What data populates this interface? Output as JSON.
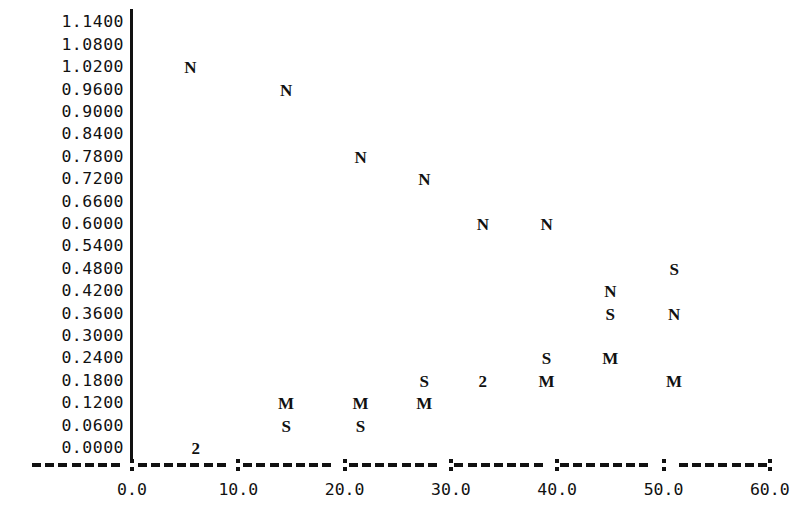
{
  "chart_data": {
    "type": "scatter",
    "title": "",
    "subtitle": "",
    "xlabel": "",
    "ylabel": "",
    "xlim": [
      -2.0,
      62.0
    ],
    "ylim": [
      0.0,
      1.14
    ],
    "grid": false,
    "legend": "none",
    "marker_style": "text-letter",
    "y_ticks": [
      "1.1400",
      "1.0800",
      "1.0200",
      "0.9600",
      "0.9000",
      "0.8400",
      "0.7800",
      "0.7200",
      "0.6600",
      "0.6000",
      "0.5400",
      "0.4800",
      "0.4200",
      "0.3600",
      "0.3000",
      "0.2400",
      "0.1800",
      "0.1200",
      "0.0600",
      "0.0000"
    ],
    "y_tick_values": [
      1.14,
      1.08,
      1.02,
      0.96,
      0.9,
      0.84,
      0.78,
      0.72,
      0.66,
      0.6,
      0.54,
      0.48,
      0.42,
      0.36,
      0.3,
      0.24,
      0.18,
      0.12,
      0.06,
      0.0
    ],
    "x_ticks": [
      "0.0",
      "10.0",
      "20.0",
      "30.0",
      "40.0",
      "50.0",
      "60.0"
    ],
    "x_tick_values": [
      0,
      10,
      20,
      30,
      40,
      50,
      60
    ],
    "series": [
      {
        "name": "N",
        "label": "N",
        "points": [
          {
            "x": 5.5,
            "y": 1.02,
            "label": "N"
          },
          {
            "x": 14.5,
            "y": 0.96,
            "label": "N"
          },
          {
            "x": 21.5,
            "y": 0.78,
            "label": "N"
          },
          {
            "x": 27.5,
            "y": 0.72,
            "label": "N"
          },
          {
            "x": 33.0,
            "y": 0.6,
            "label": "N"
          },
          {
            "x": 39.0,
            "y": 0.6,
            "label": "N"
          },
          {
            "x": 45.0,
            "y": 0.42,
            "label": "N"
          },
          {
            "x": 51.0,
            "y": 0.36,
            "label": "N"
          }
        ]
      },
      {
        "name": "S",
        "label": "S",
        "points": [
          {
            "x": 14.5,
            "y": 0.06,
            "label": "S"
          },
          {
            "x": 21.5,
            "y": 0.06,
            "label": "S"
          },
          {
            "x": 27.5,
            "y": 0.18,
            "label": "S"
          },
          {
            "x": 39.0,
            "y": 0.24,
            "label": "S"
          },
          {
            "x": 45.0,
            "y": 0.36,
            "label": "S"
          },
          {
            "x": 51.0,
            "y": 0.48,
            "label": "S"
          }
        ]
      },
      {
        "name": "M",
        "label": "M",
        "points": [
          {
            "x": 14.5,
            "y": 0.12,
            "label": "M"
          },
          {
            "x": 21.5,
            "y": 0.12,
            "label": "M"
          },
          {
            "x": 27.5,
            "y": 0.12,
            "label": "M"
          },
          {
            "x": 39.0,
            "y": 0.18,
            "label": "M"
          },
          {
            "x": 45.0,
            "y": 0.24,
            "label": "M"
          },
          {
            "x": 51.0,
            "y": 0.18,
            "label": "M"
          }
        ]
      },
      {
        "name": "overlap-count",
        "label": "2",
        "points": [
          {
            "x": 6.0,
            "y": 0.0,
            "label": "2"
          },
          {
            "x": 33.0,
            "y": 0.18,
            "label": "2"
          }
        ]
      }
    ]
  },
  "axes": {
    "y_axis_line_name": "y-axis-line",
    "x_axis_line_name": "x-axis-line"
  }
}
